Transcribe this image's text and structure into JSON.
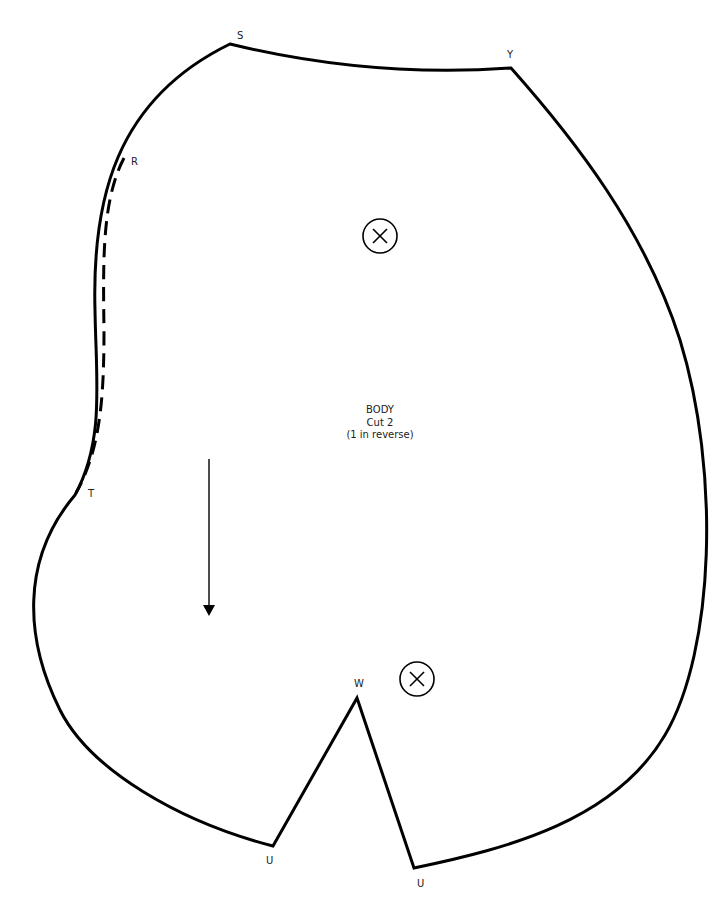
{
  "pattern_piece": {
    "name": "BODY",
    "cut_instruction": "Cut 2",
    "reverse_note": "(1 in reverse)"
  },
  "point_labels": {
    "S": "S",
    "Y": "Y",
    "R": "R",
    "T": "T",
    "W": "W",
    "U_left": "U",
    "U_right": "U"
  },
  "markings": {
    "placement_marks": [
      {
        "name": "circled-x-upper",
        "cx": 380,
        "cy": 236
      },
      {
        "name": "circled-x-lower",
        "cx": 417,
        "cy": 679
      }
    ],
    "grainline_arrow": {
      "x": 209,
      "y1": 459,
      "y2": 615,
      "direction": "down"
    },
    "opening_line": {
      "from": "R",
      "to": "T",
      "style": "dashed"
    }
  },
  "colors": {
    "line": "#000000",
    "background": "#ffffff",
    "text": "#222222"
  }
}
